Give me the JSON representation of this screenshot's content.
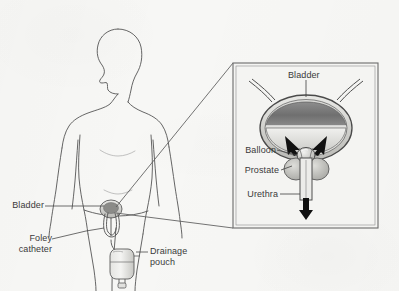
{
  "figure": {
    "background_color": "#f7f7f5",
    "ink_color": "#4a4a4a",
    "label_color": "#3a3a3a"
  },
  "body_view": {
    "name": "patient-body-outline",
    "description": "Front outline of a human torso and head, shown from the chest down to the thighs"
  },
  "labels": {
    "bladder_body": "Bladder",
    "foley_catheter": "Foley\ncatheter",
    "drainage_pouch": "Drainage\npouch"
  },
  "inset": {
    "name": "magnified-bladder-detail",
    "border_color": "#6b6b6b",
    "labels": {
      "bladder": "Bladder",
      "balloon": "Balloon",
      "prostate": "Prostate",
      "urethra": "Urethra"
    },
    "anatomy": [
      {
        "part": "ureter-left",
        "note": "tube entering bladder from upper left"
      },
      {
        "part": "ureter-right",
        "note": "tube entering bladder from upper right"
      },
      {
        "part": "bladder-wall",
        "note": "rounded bladder with shaded interior"
      },
      {
        "part": "balloon",
        "note": "inflated retention balloon at bladder neck"
      },
      {
        "part": "prostate",
        "note": "gland lobes surrounding the urethra"
      },
      {
        "part": "urethra",
        "note": "vertical tube exiting downward"
      },
      {
        "part": "flow-arrow-down",
        "note": "bold arrow showing urine drainage direction"
      },
      {
        "part": "flow-arrow-left",
        "note": "arrow pointing toward balloon"
      },
      {
        "part": "flow-arrow-right",
        "note": "arrow pointing toward balloon"
      }
    ]
  },
  "equipment": [
    {
      "part": "catheter-tube",
      "note": "tube running from urethra to drainage pouch"
    },
    {
      "part": "drainage-pouch",
      "note": "collection bag with outlet spout at bottom"
    }
  ]
}
